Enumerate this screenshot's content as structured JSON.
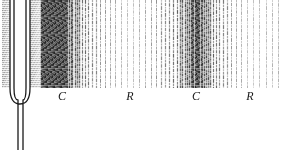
{
  "figure": {
    "background_color": "#ffffff",
    "ink_color": "#1a1a1a",
    "width": 282,
    "height": 150
  },
  "tuning_fork": {
    "name": "tuning-fork",
    "prong_left_x": 10,
    "prong_right_x": 30,
    "prong_top_y": 0,
    "bend_y": 96,
    "stem_top_y": 112,
    "stem_bottom_y": 150,
    "stem_x": 20,
    "outline_color": "#1a1a1a",
    "fill_color": "#ffffff"
  },
  "vibration_blur": {
    "name": "vibration-blur",
    "left_band_x": 2,
    "left_band_width": 10,
    "right_band_x": 30,
    "right_band_width": 12,
    "top": 0,
    "height": 88,
    "color": "#555555"
  },
  "wave_band": {
    "name": "sound-wave-band",
    "x": 40,
    "y": 0,
    "width": 242,
    "height": 88,
    "line_color": "#2b2b2b"
  },
  "labels": [
    {
      "text": "C",
      "meaning": "compression",
      "x": 62,
      "y": 89
    },
    {
      "text": "R",
      "meaning": "rarefaction",
      "x": 130,
      "y": 89
    },
    {
      "text": "C",
      "meaning": "compression",
      "x": 196,
      "y": 89
    },
    {
      "text": "R",
      "meaning": "rarefaction",
      "x": 250,
      "y": 89
    }
  ],
  "chart_data": {
    "type": "line",
    "xlabel": "Distance from fork",
    "ylabel": "Particle density",
    "x": [
      40,
      62,
      96,
      130,
      163,
      196,
      223,
      250,
      278
    ],
    "values": [
      1.0,
      1.0,
      0.45,
      0.12,
      0.45,
      1.0,
      0.5,
      0.12,
      0.2
    ],
    "categories": [
      "C",
      "C",
      "transition",
      "R",
      "transition",
      "C",
      "transition",
      "R",
      "edge"
    ],
    "annotations": [
      "C",
      "R",
      "C",
      "R"
    ],
    "grid": false,
    "legend": "none"
  }
}
